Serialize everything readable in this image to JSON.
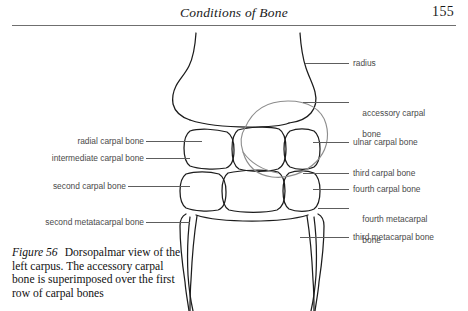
{
  "header": {
    "title": "Conditions of Bone",
    "folio": "155"
  },
  "figure": {
    "number": "Figure 56",
    "caption": "Dorsopalmar view of the left carpus. The accessory carpal bone is superimposed over the first row of carpal bones",
    "caption_lines": [
      "Dorsopalmar view of the",
      "left carpus. The accessory carpal",
      "bone is superimposed over the first",
      "row of carpal bones"
    ]
  },
  "labels": {
    "left": [
      {
        "id": "radial-carpal-bone",
        "text": "radial carpal bone"
      },
      {
        "id": "intermediate-carpal-bone",
        "text": "intermediate carpal bone"
      },
      {
        "id": "second-carpal-bone",
        "text": "second carpal bone"
      },
      {
        "id": "second-metatacarpal-bone",
        "text": "second metatacarpal bone"
      }
    ],
    "right": [
      {
        "id": "radius",
        "text": "radius"
      },
      {
        "id": "accessory-carpal-bone",
        "line1": "accessory carpal",
        "line2": "bone"
      },
      {
        "id": "ulnar-carpal-bone",
        "text": "ulnar carpal bone"
      },
      {
        "id": "third-carpal-bone",
        "text": "third carpal bone"
      },
      {
        "id": "fourth-carpal-bone",
        "text": "fourth carpal bone"
      },
      {
        "id": "fourth-metacarpal-bone",
        "line1": "fourth metacarpal",
        "line2": "bone"
      },
      {
        "id": "third-metacarpal-bone",
        "text": "third metacarpal bone"
      }
    ]
  },
  "colors": {
    "ink": "#111111",
    "rule": "#6f6f6f",
    "label_text": "#4a4a4a",
    "leader": "#5d5d5d",
    "bone_outline": "#1c1c1c",
    "accessory_outline": "#8d8d8d"
  }
}
